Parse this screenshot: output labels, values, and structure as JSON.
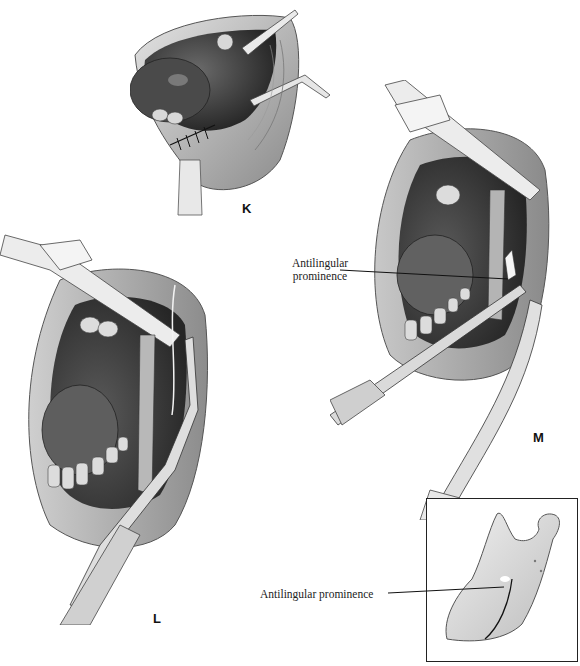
{
  "figure": {
    "panels": [
      {
        "id": "K",
        "letter": "K",
        "description": "Closed incision with interrupted sutures, retractors in place"
      },
      {
        "id": "L",
        "letter": "L",
        "description": "Open mouth with retractor and curved instrument along the ramus"
      },
      {
        "id": "M",
        "letter": "M",
        "description": "Open mouth with retractors exposing the antilingular prominence"
      }
    ],
    "callouts": [
      {
        "id": "m-callout",
        "label_line1": "Antilingular",
        "label_line2": "prominence"
      },
      {
        "id": "inset-callout",
        "label": "Antilingular prominence"
      }
    ],
    "inset": {
      "description": "Mandibular ramus with osteotomy line behind the antilingular prominence"
    },
    "colors": {
      "ink": "#1a1a1a",
      "tissue_dark": "#3a3a3a",
      "tissue_mid": "#8a8a8a",
      "tissue_light": "#d6d6d6",
      "background": "#ffffff"
    }
  }
}
